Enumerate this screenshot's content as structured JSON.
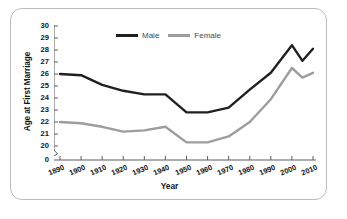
{
  "chart_data": {
    "type": "line",
    "title": "",
    "xlabel": "Year",
    "ylabel": "Age at First Marriage",
    "x": [
      1890,
      1900,
      1910,
      1920,
      1930,
      1940,
      1950,
      1960,
      1970,
      1980,
      1990,
      2000,
      2005,
      2010
    ],
    "xlim": [
      1890,
      2010
    ],
    "ylim": [
      20,
      30
    ],
    "y_axis_break": true,
    "y_ticks": [
      "30",
      "29",
      "28",
      "27",
      "26",
      "25",
      "24",
      "23",
      "22",
      "21",
      "20",
      "0"
    ],
    "x_ticks": [
      "1890",
      "1900",
      "1910",
      "1920",
      "1930",
      "1940",
      "1950",
      "1960",
      "1970",
      "1980",
      "1990",
      "2000",
      "2010"
    ],
    "grid": false,
    "legend_position": "top-center",
    "series": [
      {
        "name": "Male",
        "color": "#231f20",
        "values": [
          26.0,
          25.9,
          25.1,
          24.6,
          24.3,
          24.3,
          22.8,
          22.8,
          23.2,
          24.7,
          26.1,
          28.4,
          27.1,
          28.1
        ]
      },
      {
        "name": "Female",
        "color": "#9d9d9d",
        "values": [
          22.0,
          21.9,
          21.6,
          21.2,
          21.3,
          21.6,
          20.3,
          20.3,
          20.8,
          22.0,
          23.9,
          26.5,
          25.7,
          26.1
        ]
      }
    ]
  },
  "axes": {
    "y_title": "Age at First Marriage",
    "x_title": "Year",
    "y_tick_labels": [
      "30",
      "29",
      "28",
      "27",
      "26",
      "25",
      "24",
      "23",
      "22",
      "21",
      "20",
      "0"
    ],
    "x_tick_labels": [
      "1890",
      "1900",
      "1910",
      "1920",
      "1930",
      "1940",
      "1950",
      "1960",
      "1970",
      "1980",
      "1990",
      "2000",
      "2010"
    ]
  },
  "legend": {
    "items": [
      {
        "label": "Male",
        "color": "#231f20"
      },
      {
        "label": "Female",
        "color": "#9d9d9d"
      }
    ]
  },
  "colors": {
    "male_line": "#231f20",
    "female_line": "#9d9d9d",
    "axis": "#5a5d61",
    "frame_border": "#b9bcc0",
    "background": "#ffffff",
    "text": "#141414"
  }
}
